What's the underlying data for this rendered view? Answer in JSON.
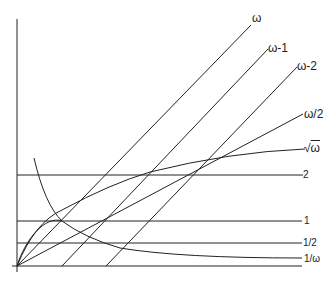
{
  "diagram": {
    "title": "",
    "axes": {
      "origin": "O",
      "x_axis": "ω",
      "y_axis": "f(ω)"
    },
    "curves": [
      {
        "id": "omega",
        "label": "ω",
        "type": "line",
        "expr": "y = ω"
      },
      {
        "id": "omega-minus-1",
        "label": "ω-1",
        "type": "line",
        "expr": "y = ω - 1"
      },
      {
        "id": "omega-minus-2",
        "label": "ω-2",
        "type": "line",
        "expr": "y = ω - 2"
      },
      {
        "id": "omega-half",
        "label": "ω/2",
        "type": "line",
        "expr": "y = ω/2"
      },
      {
        "id": "sqrt-omega",
        "label": "√ω",
        "type": "curve",
        "expr": "y = √ω"
      },
      {
        "id": "two",
        "label": "2",
        "type": "horizontal",
        "expr": "y = 2"
      },
      {
        "id": "one",
        "label": "1",
        "type": "horizontal",
        "expr": "y = 1"
      },
      {
        "id": "half",
        "label": "1/2",
        "type": "horizontal",
        "expr": "y = 1/2"
      },
      {
        "id": "inverse-omega",
        "label": "1/ω",
        "type": "curve",
        "expr": "y = 1/ω"
      }
    ]
  },
  "labels": {
    "omega": "ω",
    "omega_minus_1": "ω-1",
    "omega_minus_2": "ω-2",
    "omega_half": "ω/2",
    "sqrt_symbol": "√",
    "sqrt_arg": "ω",
    "two": "2",
    "one": "1",
    "half": "1/2",
    "inverse_omega": "1/ω"
  },
  "colors": {
    "ink": "#222222",
    "background": "#ffffff"
  }
}
